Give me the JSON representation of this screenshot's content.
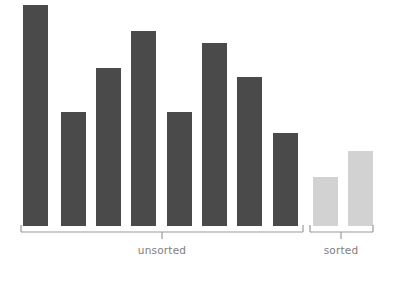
{
  "chart_data": {
    "type": "bar",
    "title": "",
    "subtitle": "",
    "xlabel": "",
    "ylabel": "",
    "grid": false,
    "axis_visible": false,
    "legend": "none",
    "ylim": [
      0,
      100
    ],
    "categories": [
      "1",
      "2",
      "3",
      "4",
      "5",
      "6",
      "7",
      "8",
      "9",
      "10"
    ],
    "values": [
      100,
      51.6,
      71.5,
      88.2,
      51.6,
      82.8,
      67.4,
      42.1,
      22.2,
      33.9
    ],
    "bar_colors": [
      "#4a4a4a",
      "#4a4a4a",
      "#4a4a4a",
      "#4a4a4a",
      "#4a4a4a",
      "#4a4a4a",
      "#4a4a4a",
      "#4a4a4a",
      "#d2d2d2",
      "#d2d2d2"
    ],
    "tick_labels": [],
    "annotations": [
      {
        "text": "unsorted",
        "covers": [
          1,
          2,
          3,
          4,
          5,
          6,
          7,
          8
        ],
        "bracket": true
      },
      {
        "text": "sorted",
        "covers": [
          9,
          10
        ],
        "bracket": true
      }
    ],
    "groups": [
      {
        "name": "unsorted",
        "label": "unsorted",
        "color": "#4a4a4a",
        "bar_count": 8,
        "values": [
          100,
          51.6,
          71.5,
          88.2,
          51.6,
          82.8,
          67.4,
          42.1
        ]
      },
      {
        "name": "sorted",
        "label": "sorted",
        "color": "#d2d2d2",
        "bar_count": 2,
        "values": [
          22.2,
          33.9
        ]
      }
    ]
  },
  "figure": {
    "background": "#ffffff",
    "bar_dark_color": "#4a4a4a",
    "bar_light_color": "#d2d2d2",
    "bracket_color": "#9a9a9a",
    "label_color": "#7d7d7d"
  },
  "bars": [
    {
      "name": "bar-1",
      "x": 23,
      "width": 25,
      "top": 5,
      "height": 221,
      "color": "#4a4a4a",
      "group": "unsorted",
      "value": 100
    },
    {
      "name": "bar-2",
      "x": 61,
      "width": 25,
      "top": 112,
      "height": 114,
      "color": "#4a4a4a",
      "group": "unsorted",
      "value": 51.6
    },
    {
      "name": "bar-3",
      "x": 96,
      "width": 25,
      "top": 68,
      "height": 158,
      "color": "#4a4a4a",
      "group": "unsorted",
      "value": 71.5
    },
    {
      "name": "bar-4",
      "x": 131,
      "width": 25,
      "top": 31,
      "height": 195,
      "color": "#4a4a4a",
      "group": "unsorted",
      "value": 88.2
    },
    {
      "name": "bar-5",
      "x": 167,
      "width": 25,
      "top": 112,
      "height": 114,
      "color": "#4a4a4a",
      "group": "unsorted",
      "value": 51.6
    },
    {
      "name": "bar-6",
      "x": 202,
      "width": 25,
      "top": 43,
      "height": 183,
      "color": "#4a4a4a",
      "group": "unsorted",
      "value": 82.8
    },
    {
      "name": "bar-7",
      "x": 237,
      "width": 25,
      "top": 77,
      "height": 149,
      "color": "#4a4a4a",
      "group": "unsorted",
      "value": 67.4
    },
    {
      "name": "bar-8",
      "x": 273,
      "width": 25,
      "top": 133,
      "height": 93,
      "color": "#4a4a4a",
      "group": "unsorted",
      "value": 42.1
    },
    {
      "name": "bar-9",
      "x": 313,
      "width": 25,
      "top": 177,
      "height": 49,
      "color": "#d2d2d2",
      "group": "sorted",
      "value": 22.2
    },
    {
      "name": "bar-10",
      "x": 348,
      "width": 25,
      "top": 151,
      "height": 75,
      "color": "#d2d2d2",
      "group": "sorted",
      "value": 33.9
    }
  ],
  "brackets": [
    {
      "name": "unsorted-bracket",
      "x1": 21,
      "x2": 303,
      "y": 232,
      "tick": 7,
      "center": 162,
      "label": "unsorted"
    },
    {
      "name": "sorted-bracket",
      "x1": 310,
      "x2": 373,
      "y": 232,
      "tick": 7,
      "center": 341,
      "label": "sorted"
    }
  ],
  "labels": {
    "unsorted": "unsorted",
    "sorted": "sorted"
  }
}
